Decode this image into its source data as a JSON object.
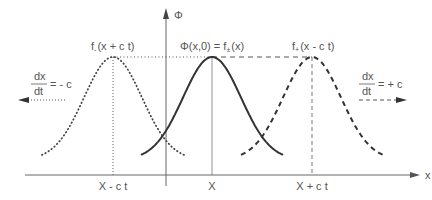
{
  "diagram": {
    "axes": {
      "y_label": "Φ",
      "x_label": "x"
    },
    "curves": [
      {
        "id": "left",
        "style": "dotted",
        "label_main": "f",
        "label_sub": "-",
        "label_arg": "(x + c t)",
        "center_label": "X - c t",
        "velocity_num": "dx",
        "velocity_den": "dt",
        "velocity_value": "= - c"
      },
      {
        "id": "center",
        "style": "solid",
        "label": "Φ(x,0) = f",
        "label_sub": "±",
        "label_arg": "(x)",
        "center_label": "X"
      },
      {
        "id": "right",
        "style": "dashed",
        "label_main": "f",
        "label_sub": "+",
        "label_arg": "(x - c t)",
        "center_label": "X + c t",
        "velocity_num": "dx",
        "velocity_den": "dt",
        "velocity_value": "= + c"
      }
    ],
    "colors": {
      "line": "#333333",
      "text": "#555555",
      "axis": "#666666"
    }
  }
}
